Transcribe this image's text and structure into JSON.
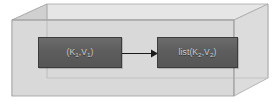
{
  "diagram": {
    "container": {
      "name": "3d-box",
      "face_color": "#d9d9d9",
      "top_color": "#e4e4e4",
      "side_color": "#cdcdcd",
      "edge_color": "#9a9a9a"
    },
    "nodes": [
      {
        "id": "input-pair",
        "label_plain": "(K1,V1)",
        "label_base": "(K",
        "sub1": "1",
        "label_mid": ",V",
        "sub2": "1",
        "label_end": ")",
        "fill": "#5d5d5d",
        "text_color": "#cfcfcf"
      },
      {
        "id": "output-list",
        "label_plain": "list(K2,V2)",
        "label_base": "list(K",
        "sub1": "2",
        "label_mid": ",V",
        "sub2": "2",
        "label_end": ")",
        "fill": "#5d5d5d",
        "text_color": "#cfcfcf"
      }
    ],
    "connector": {
      "name": "arrow-right",
      "from": "input-pair",
      "to": "output-list",
      "color": "#1a1a1a",
      "style": "solid-line-with-arrowhead"
    }
  }
}
